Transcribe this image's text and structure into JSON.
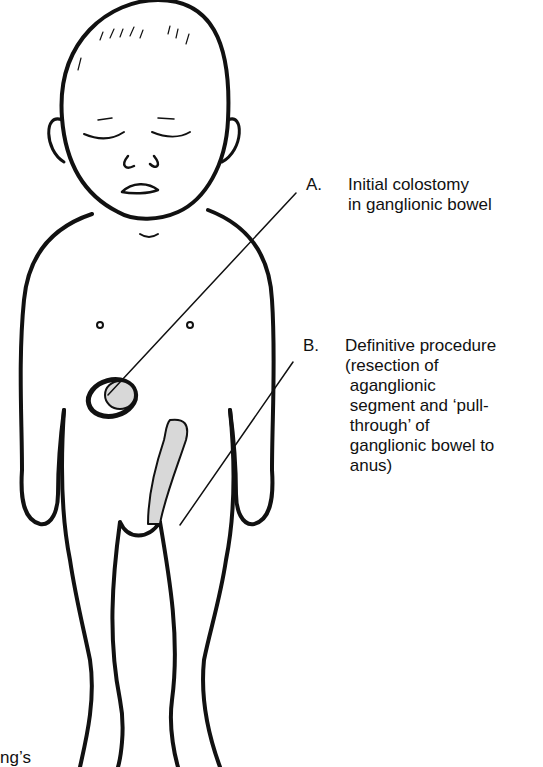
{
  "figure": {
    "colors": {
      "ink": "#111111",
      "background": "#ffffff",
      "stipple_fill": "#d8d8d8"
    }
  },
  "labels": {
    "a": {
      "letter": "A.",
      "text": "Initial colostomy\nin ganglionic bowel"
    },
    "b": {
      "letter": "B.",
      "text": "Definitive procedure\n(resection of\n aganglionic\n segment and ‘pull-\n through’ of\n ganglionic bowel to\n anus)"
    }
  },
  "cropped_text": "ng’s"
}
